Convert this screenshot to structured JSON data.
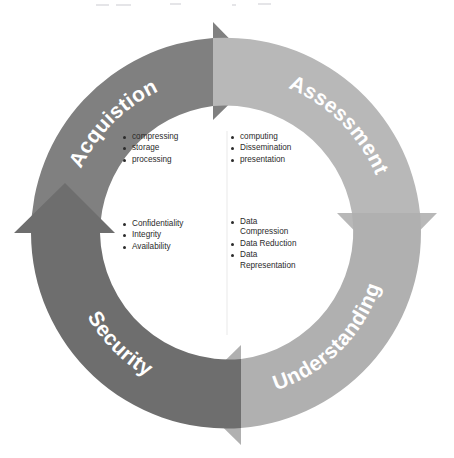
{
  "diagram": {
    "type": "cycle",
    "direction": "clockwise",
    "background_color": "#ffffff",
    "segments": [
      {
        "id": "acquisition",
        "label": "Acquistion",
        "position": "top-left",
        "color": "#808080",
        "label_color": "#ffffff",
        "label_orientation": "upright-along-arc",
        "bullets": [
          "compressing",
          "storage",
          "processing"
        ]
      },
      {
        "id": "assessment",
        "label": "Assessment",
        "position": "top-right",
        "color": "#b8b8b8",
        "label_color": "#ffffff",
        "label_orientation": "upright-along-arc",
        "bullets": [
          "computing",
          "Dissemination",
          "presentation"
        ]
      },
      {
        "id": "understanding",
        "label": "Understanding",
        "position": "bottom-right",
        "color": "#b0b0b0",
        "label_color": "#ffffff",
        "label_orientation": "inverted-along-arc",
        "bullets": [
          "Data\nCompression",
          "Data Reduction",
          "Data\nRepresentation"
        ]
      },
      {
        "id": "security",
        "label": "Security",
        "position": "bottom-left",
        "color": "#6e6e6e",
        "label_color": "#ffffff",
        "label_orientation": "inverted-along-arc",
        "bullets": [
          "Confidentiality",
          "Integrity",
          "Availability"
        ]
      }
    ],
    "arrowheads": [
      {
        "id": "arrowhead-top",
        "at_clock": 12,
        "points": "right"
      },
      {
        "id": "arrowhead-right",
        "at_clock": 3,
        "points": "down"
      },
      {
        "id": "arrowhead-bottom",
        "at_clock": 6,
        "points": "left"
      },
      {
        "id": "arrowhead-left",
        "at_clock": 9,
        "points": "up"
      }
    ],
    "center_fill": "#ffffff",
    "bullet_text_color": "#2b2b2b"
  }
}
